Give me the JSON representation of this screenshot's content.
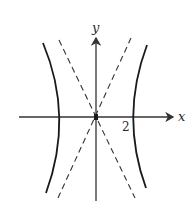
{
  "figure": {
    "type": "hyperbola",
    "axes": {
      "x_label": "x",
      "y_label": "y",
      "tick_label": "2",
      "tick_value": 2
    },
    "curves": {
      "branches": [
        "left",
        "right"
      ],
      "vertices": [
        [
          -2,
          0
        ],
        [
          2,
          0
        ]
      ],
      "asymptotes": "two dashed lines through origin"
    },
    "colors": {
      "curve": "#1a1a1a",
      "axis": "#333333",
      "asymptote": "#333333",
      "background": "#ffffff"
    }
  }
}
